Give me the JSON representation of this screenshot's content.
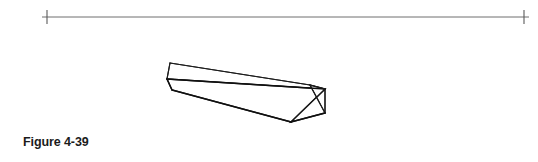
{
  "figure": {
    "caption": "Figure 4-39",
    "page_background": "#ffffff",
    "ink_color": "#161616",
    "horizon_color": "#6e6e6e"
  },
  "horizon": {
    "name": "horizon-line",
    "y": 17,
    "x_start": 42,
    "x_end": 529,
    "stroke_width": 1,
    "color": "#6e6e6e"
  },
  "vanishing_points": [
    {
      "label": "left-vanishing-point",
      "x": 47,
      "y_top": 10,
      "y_bottom": 24,
      "color": "#5a5a5a"
    },
    {
      "label": "right-vanishing-point",
      "x": 524,
      "y_top": 10,
      "y_bottom": 24,
      "color": "#5a5a5a"
    }
  ],
  "box": {
    "name": "rectangular-prism",
    "description": "long rectangular beam drawn in two-point perspective",
    "fill": "#ffffff",
    "stroke": "#161616",
    "stroke_width": 1.2,
    "vertices": {
      "top_back_left": [
        170,
        63
      ],
      "top_back_right": [
        310,
        85
      ],
      "top_front_right": [
        325,
        89
      ],
      "top_front_left": [
        167,
        79
      ],
      "bottom_front_left": [
        172,
        90
      ],
      "bottom_front_right": [
        291,
        122
      ],
      "bottom_back_right": [
        325,
        113
      ]
    },
    "faces": {
      "top": "top_back_left, top_back_right, top_front_right, top_front_left",
      "front_long": "top_front_left, top_front_right, bottom_front_right, bottom_front_left",
      "right_end": "top_front_right, top_back_right, bottom_back_right, bottom_front_right"
    }
  }
}
